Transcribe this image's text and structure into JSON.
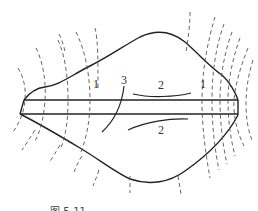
{
  "diagram": {
    "type": "technical-schematic",
    "labels": [
      {
        "id": "label-1-left",
        "text": "1",
        "x": 93,
        "y": 88
      },
      {
        "id": "label-3",
        "text": "3",
        "x": 124,
        "y": 84
      },
      {
        "id": "label-2-top",
        "text": "2",
        "x": 161,
        "y": 89
      },
      {
        "id": "label-1-right",
        "text": "1",
        "x": 203,
        "y": 88
      },
      {
        "id": "label-2-bottom",
        "text": "2",
        "x": 161,
        "y": 134
      }
    ],
    "caption": "图 5-11  ..."
  },
  "colors": {
    "line": "#222222",
    "dashed": "#555555",
    "background": "#ffffff"
  }
}
